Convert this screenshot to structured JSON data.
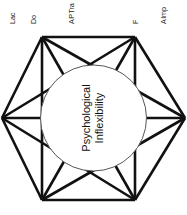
{
  "figure": {
    "type": "hexagon-network-diagram",
    "center": {
      "line1": "Psychological",
      "line2": "Inflexibility"
    },
    "labels": [
      {
        "id": "label-1",
        "text": "Lac",
        "full_visible": "Lac"
      },
      {
        "id": "label-2",
        "text": "Do",
        "full_visible": "Do"
      },
      {
        "id": "label-3",
        "line1": "Tra",
        "line2": "P",
        "line3": "A"
      },
      {
        "id": "label-4",
        "text": "F"
      },
      {
        "id": "label-5",
        "line1": "Imp",
        "line2": "A"
      }
    ],
    "colors": {
      "line": "#111111",
      "circle_stroke": "#555555",
      "background": "#ffffff",
      "text": "#1a1a1a"
    },
    "vertices": [
      {
        "name": "top-left",
        "x": 42,
        "y": 12
      },
      {
        "name": "top-right",
        "x": 135,
        "y": 12
      },
      {
        "name": "right",
        "x": 185,
        "y": 93
      },
      {
        "name": "bottom-right",
        "x": 135,
        "y": 175
      },
      {
        "name": "bottom-left",
        "x": 42,
        "y": 175
      },
      {
        "name": "left",
        "x": 2,
        "y": 93
      }
    ]
  }
}
